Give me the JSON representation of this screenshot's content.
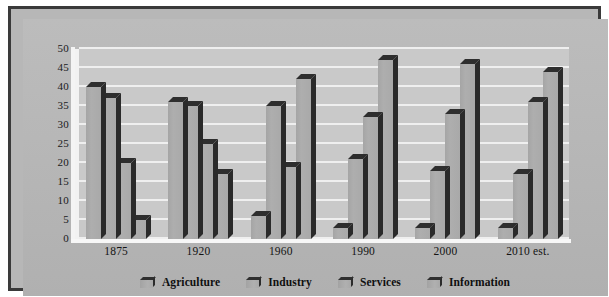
{
  "chart_data": {
    "type": "bar",
    "title": "",
    "subtitle": "",
    "xlabel": "",
    "ylabel": "",
    "ylim": [
      0,
      50
    ],
    "yticks": [
      0,
      5,
      10,
      15,
      20,
      25,
      30,
      35,
      40,
      45,
      50
    ],
    "grid": true,
    "legend_position": "bottom",
    "categories": [
      "1875",
      "1920",
      "1960",
      "1990",
      "2000",
      "2010 est."
    ],
    "series": [
      {
        "name": "Agriculture",
        "values": [
          40,
          36,
          6,
          3,
          3,
          3
        ]
      },
      {
        "name": "Industry",
        "values": [
          37,
          35,
          35,
          21,
          18,
          17
        ]
      },
      {
        "name": "Services",
        "values": [
          20,
          25,
          19,
          32,
          33,
          36
        ]
      },
      {
        "name": "Information",
        "values": [
          5,
          17,
          42,
          47,
          46,
          44
        ]
      }
    ]
  },
  "legend": {
    "items": [
      {
        "label": "Agriculture",
        "swatch": "bar-swatch-icon"
      },
      {
        "label": "Industry",
        "swatch": "bar-swatch-icon"
      },
      {
        "label": "Services",
        "swatch": "bar-swatch-icon"
      },
      {
        "label": "Information",
        "swatch": "bar-swatch-icon"
      }
    ]
  },
  "colors": {
    "frame_border": "#3a3a3a",
    "panel_background": "#b7b7b7",
    "plot_background": "#c9c9c9",
    "gridline": "#efefef",
    "bar_face": "#a9a9a9",
    "bar_shadow": "#2e2e2e",
    "text": "#141414"
  }
}
